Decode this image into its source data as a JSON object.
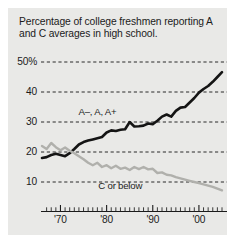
{
  "title": "Percentage of college freshmen reporting A and C averages in high school.",
  "labels": {
    "series_a": "A–, A, A+",
    "series_c": "C or below"
  },
  "colors": {
    "background": "#e9e9e7",
    "page": "#ffffff",
    "series_a": "#141414",
    "series_c": "#b0b0ac",
    "grid": "#2b2b2b",
    "axis": "#1b1b1b",
    "text": "#1b1b1b"
  },
  "chart_data": {
    "type": "line",
    "title": "Percentage of college freshmen reporting A and C averages in high school.",
    "xlabel": "",
    "ylabel": "",
    "xlim": [
      1966,
      2005
    ],
    "ylim": [
      5,
      52
    ],
    "grid": true,
    "grid_style": "dashed-horizontal",
    "legend": "inline-annotations",
    "yticks": [
      10,
      20,
      30,
      40,
      50
    ],
    "yticklabels": [
      "10",
      "20",
      "30",
      "40",
      "50%"
    ],
    "xticks": [
      1970,
      1980,
      1990,
      2000
    ],
    "xticklabels": [
      "'70",
      "'80",
      "'90",
      "'00"
    ],
    "minor_xticks_interval": 1,
    "x": [
      1966,
      1967,
      1968,
      1969,
      1970,
      1971,
      1972,
      1973,
      1974,
      1975,
      1976,
      1977,
      1978,
      1979,
      1980,
      1981,
      1982,
      1983,
      1984,
      1985,
      1986,
      1987,
      1988,
      1989,
      1990,
      1991,
      1992,
      1993,
      1994,
      1995,
      1996,
      1997,
      1998,
      1999,
      2000,
      2001,
      2002,
      2003,
      2004,
      2005
    ],
    "series": [
      {
        "name": "A–, A, A+",
        "color": "#141414",
        "width": 2.6,
        "values": [
          18.0,
          18.3,
          19.0,
          19.4,
          19.0,
          18.6,
          19.6,
          21.0,
          22.5,
          23.3,
          23.8,
          24.2,
          24.6,
          25.0,
          26.5,
          27.2,
          27.0,
          27.4,
          27.6,
          30.0,
          28.5,
          28.6,
          28.8,
          29.5,
          29.3,
          30.4,
          31.8,
          32.5,
          31.8,
          33.7,
          34.8,
          35.0,
          36.5,
          38.0,
          39.8,
          41.0,
          42.0,
          43.4,
          45.0,
          46.6
        ]
      },
      {
        "name": "C or below",
        "color": "#b0b0ac",
        "width": 2.4,
        "values": [
          22.0,
          21.0,
          23.0,
          21.6,
          20.6,
          21.5,
          20.4,
          19.6,
          18.6,
          17.6,
          16.4,
          15.6,
          16.4,
          15.0,
          15.6,
          14.6,
          15.4,
          14.4,
          14.8,
          14.0,
          15.0,
          14.3,
          15.0,
          14.2,
          14.4,
          13.0,
          13.2,
          12.4,
          12.2,
          11.6,
          11.2,
          10.8,
          10.4,
          10.0,
          9.6,
          9.2,
          8.8,
          8.4,
          7.8,
          7.2
        ]
      }
    ],
    "annotations": [
      {
        "text": "A–, A, A+",
        "x": 1983,
        "y": 33
      },
      {
        "text": "C or below",
        "x": 1986,
        "y": 8.5
      }
    ]
  }
}
